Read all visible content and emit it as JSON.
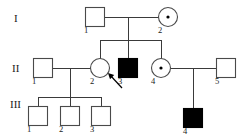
{
  "figure": {
    "type": "pedigree-chart",
    "background_color": "#ffffff",
    "line_color": "#3a3a3a",
    "symbol_stroke_color": "#4a4a4a",
    "affected_fill_color": "#000000",
    "unaffected_fill_color": "#ffffff"
  },
  "generation_labels": [
    {
      "id": "gen-I",
      "text": "I",
      "x": 14,
      "y": 22
    },
    {
      "id": "gen-II",
      "text": "II",
      "x": 12,
      "y": 72
    },
    {
      "id": "gen-III",
      "text": "III",
      "x": 10,
      "y": 108
    }
  ],
  "individuals": [
    {
      "id": "I-1",
      "generation": "I",
      "number": "1",
      "sex": "male",
      "shape": "square",
      "status": "unaffected",
      "carrier": false,
      "proband": false,
      "cx": 95,
      "cy": 17,
      "size": 19,
      "label_x": 84,
      "label_y": 33
    },
    {
      "id": "I-2",
      "generation": "I",
      "number": "2",
      "sex": "female",
      "shape": "circle",
      "status": "unaffected",
      "carrier": true,
      "proband": false,
      "cx": 168,
      "cy": 17,
      "size": 19,
      "label_x": 158,
      "label_y": 33
    },
    {
      "id": "II-1",
      "generation": "II",
      "number": "1",
      "sex": "male",
      "shape": "square",
      "status": "unaffected",
      "carrier": false,
      "proband": false,
      "cx": 43,
      "cy": 68,
      "size": 19,
      "label_x": 32,
      "label_y": 84
    },
    {
      "id": "II-2",
      "generation": "II",
      "number": "2",
      "sex": "female",
      "shape": "circle",
      "status": "unaffected",
      "carrier": false,
      "proband": true,
      "cx": 100,
      "cy": 68,
      "size": 19,
      "label_x": 90,
      "label_y": 84
    },
    {
      "id": "II-3",
      "generation": "II",
      "number": "3",
      "sex": "male",
      "shape": "square",
      "status": "affected",
      "carrier": false,
      "proband": false,
      "cx": 128,
      "cy": 68,
      "size": 19,
      "label_x": 118,
      "label_y": 84
    },
    {
      "id": "II-4",
      "generation": "II",
      "number": "4",
      "sex": "female",
      "shape": "circle",
      "status": "unaffected",
      "carrier": true,
      "proband": false,
      "cx": 161,
      "cy": 68,
      "size": 19,
      "label_x": 151,
      "label_y": 84
    },
    {
      "id": "II-5",
      "generation": "II",
      "number": "5",
      "sex": "male",
      "shape": "square",
      "status": "unaffected",
      "carrier": false,
      "proband": false,
      "cx": 226,
      "cy": 68,
      "size": 19,
      "label_x": 215,
      "label_y": 84
    },
    {
      "id": "III-1",
      "generation": "III",
      "number": "1",
      "sex": "male",
      "shape": "square",
      "status": "unaffected",
      "carrier": false,
      "proband": false,
      "cx": 38,
      "cy": 116,
      "size": 19,
      "label_x": 27,
      "label_y": 132
    },
    {
      "id": "III-2",
      "generation": "III",
      "number": "2",
      "sex": "male",
      "shape": "square",
      "status": "unaffected",
      "carrier": false,
      "proband": false,
      "cx": 70,
      "cy": 116,
      "size": 19,
      "label_x": 59,
      "label_y": 132
    },
    {
      "id": "III-3",
      "generation": "III",
      "number": "3",
      "sex": "male",
      "shape": "square",
      "status": "unaffected",
      "carrier": false,
      "proband": false,
      "cx": 101,
      "cy": 116,
      "size": 19,
      "label_x": 90,
      "label_y": 132
    },
    {
      "id": "III-4",
      "generation": "III",
      "number": "4",
      "sex": "male",
      "shape": "square",
      "status": "affected",
      "carrier": false,
      "proband": false,
      "cx": 193,
      "cy": 118,
      "size": 19,
      "label_x": 183,
      "label_y": 134
    }
  ],
  "connections": [
    {
      "id": "mating-I1-I2",
      "type": "mating-line",
      "points": "104.5,17 158.5,17"
    },
    {
      "id": "descent-I-sibship",
      "type": "descent-line",
      "points": "128,17 128,40"
    },
    {
      "id": "sibship-II",
      "type": "sibship-line",
      "points": "100,40 161,40"
    },
    {
      "id": "drop-II-2",
      "type": "drop-line",
      "points": "100,40 100,58.5"
    },
    {
      "id": "drop-II-3",
      "type": "drop-line",
      "points": "128,40 128,58.5"
    },
    {
      "id": "drop-II-4",
      "type": "drop-line",
      "points": "161,40 161,58.5"
    },
    {
      "id": "mating-II1-II2",
      "type": "mating-line",
      "points": "52.5,68 90.5,68"
    },
    {
      "id": "descent-II1-II2",
      "type": "descent-line",
      "points": "70,68 70,97"
    },
    {
      "id": "sibship-III-left",
      "type": "sibship-line",
      "points": "38,97 101,97"
    },
    {
      "id": "drop-III-1",
      "type": "drop-line",
      "points": "38,97 38,106.5"
    },
    {
      "id": "drop-III-2",
      "type": "drop-line",
      "points": "70,97 70,106.5"
    },
    {
      "id": "drop-III-3",
      "type": "drop-line",
      "points": "101,97 101,106.5"
    },
    {
      "id": "mating-II4-II5",
      "type": "mating-line",
      "points": "170.5,68 216.5,68"
    },
    {
      "id": "descent-II4-II5",
      "type": "descent-line",
      "points": "193,68 193,108.5"
    }
  ],
  "proband_marker": {
    "id": "proband-arrow",
    "points_to": "II-2",
    "shaft": "122,88 110,75",
    "tip_x": 108,
    "tip_y": 73
  }
}
